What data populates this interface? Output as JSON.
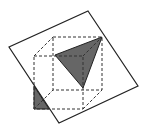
{
  "diagram": {
    "colors": {
      "stroke": "#222222",
      "shade": "#666666",
      "background": "#ffffff"
    },
    "plane": {
      "points": "88,11 138,86 59,123 9,47"
    },
    "cube_back_face": {
      "x": 53,
      "y": 37,
      "w": 49,
      "h": 53
    },
    "cube_front_face": {
      "x": 34,
      "y": 56,
      "w": 49,
      "h": 53
    },
    "triangle_section": {
      "points": "55,55 102,37 83,88"
    },
    "small_section": {
      "points": "34,86 34,109 49,109"
    }
  }
}
